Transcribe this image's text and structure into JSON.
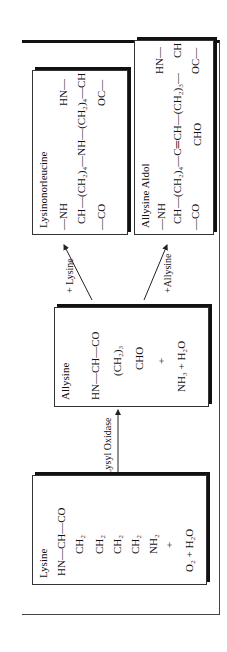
{
  "lysine": {
    "title": "Lysine",
    "backbone": "HN—CH—CO",
    "chain": [
      "CH₂",
      "CH₂",
      "CH₂",
      "CH₂",
      "NH₂"
    ],
    "plus": "+",
    "reactants": "O₂ + H₂O"
  },
  "arrow_enzyme": {
    "label": "Lysyl Oxidase"
  },
  "allysine": {
    "title": "Allysine",
    "backbone": "HN—CH—CO",
    "chain": "(CH₂)₃",
    "aldehyde": "CHO",
    "plus": "+",
    "products": "NH₃ + H₂O"
  },
  "arrow_lysine": {
    "label": "+ Lysine"
  },
  "arrow_allysine": {
    "label": "+Allysine"
  },
  "lysinonorleucine": {
    "title": "Lysinonorleucine",
    "left_top": "—NH",
    "left_mid": "CH",
    "left_bot": "—CO",
    "bridge": "—(CH₂)₄—NH—(CH₂)₄—",
    "right_top": "HN—",
    "right_mid": "CH",
    "right_bot": "OC—"
  },
  "allysine_aldol": {
    "title": "Allysine Aldol",
    "left_top": "—NH",
    "left_mid": "CH",
    "left_bot": "—CO",
    "bridge": "—(CH₂)₄—C═CH—(CH₂)₃—",
    "aldehyde": "CHO",
    "right_top": "HN—",
    "right_mid": "CH",
    "right_bot": "OC—"
  }
}
